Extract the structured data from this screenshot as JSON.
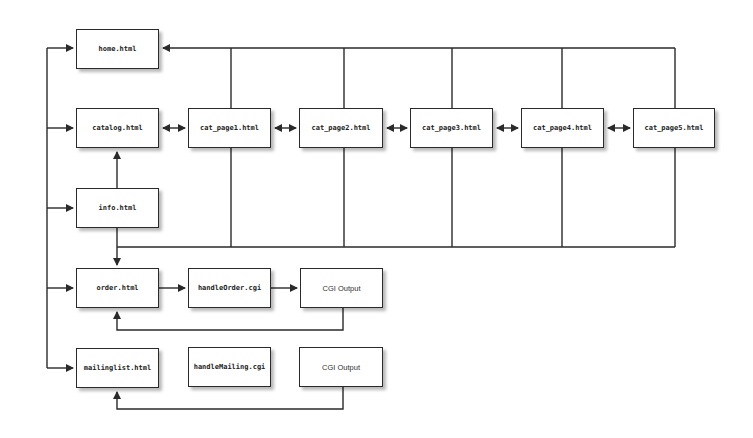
{
  "diagram": {
    "title": "",
    "nodes": [
      {
        "id": "home",
        "label": "home.html",
        "x": 76,
        "y": 29,
        "w": 83,
        "h": 40,
        "style": "mono"
      },
      {
        "id": "catalog",
        "label": "catalog.html",
        "x": 76,
        "y": 108,
        "w": 83,
        "h": 40,
        "style": "mono"
      },
      {
        "id": "cat1",
        "label": "cat_page1.html",
        "x": 188,
        "y": 108,
        "w": 83,
        "h": 40,
        "style": "mono"
      },
      {
        "id": "cat2",
        "label": "cat_page2.html",
        "x": 299,
        "y": 108,
        "w": 84,
        "h": 40,
        "style": "mono"
      },
      {
        "id": "cat3",
        "label": "cat_page3.html",
        "x": 410,
        "y": 108,
        "w": 83,
        "h": 40,
        "style": "mono"
      },
      {
        "id": "cat4",
        "label": "cat_page4.html",
        "x": 521,
        "y": 108,
        "w": 83,
        "h": 40,
        "style": "mono"
      },
      {
        "id": "cat5",
        "label": "cat_page5.html",
        "x": 633,
        "y": 108,
        "w": 82,
        "h": 40,
        "style": "mono"
      },
      {
        "id": "info",
        "label": "info.html",
        "x": 76,
        "y": 188,
        "w": 83,
        "h": 40,
        "style": "mono"
      },
      {
        "id": "order",
        "label": "order.html",
        "x": 76,
        "y": 268,
        "w": 83,
        "h": 40,
        "style": "mono"
      },
      {
        "id": "handleOrder",
        "label": "handleOrder.cgi",
        "x": 188,
        "y": 268,
        "w": 83,
        "h": 40,
        "style": "mono"
      },
      {
        "id": "cgiOut1",
        "label": "CGI Output",
        "x": 300,
        "y": 268,
        "w": 83,
        "h": 40,
        "style": "plain"
      },
      {
        "id": "mailing",
        "label": "mailinglist.html",
        "x": 76,
        "y": 348,
        "w": 83,
        "h": 40,
        "style": "mono"
      },
      {
        "id": "handleMailing",
        "label": "handleMailing.cgi",
        "x": 188,
        "y": 347,
        "w": 83,
        "h": 40,
        "style": "mono"
      },
      {
        "id": "cgiOut2",
        "label": "CGI Output",
        "x": 299,
        "y": 347,
        "w": 84,
        "h": 40,
        "style": "plain"
      }
    ],
    "edges": [
      {
        "from": "nav",
        "to": "home"
      },
      {
        "from": "nav",
        "to": "catalog"
      },
      {
        "from": "nav",
        "to": "info"
      },
      {
        "from": "nav",
        "to": "order"
      },
      {
        "from": "nav",
        "to": "mailing"
      },
      {
        "from": "catalog",
        "to": "cat1",
        "bidirectional": true
      },
      {
        "from": "cat1",
        "to": "cat2",
        "bidirectional": true
      },
      {
        "from": "cat2",
        "to": "cat3",
        "bidirectional": true
      },
      {
        "from": "cat3",
        "to": "cat4",
        "bidirectional": true
      },
      {
        "from": "cat4",
        "to": "cat5",
        "bidirectional": true
      },
      {
        "from": "cat_pages",
        "to": "home"
      },
      {
        "from": "info",
        "to": "catalog"
      },
      {
        "from": "cat_pages",
        "to": "order"
      },
      {
        "from": "info",
        "to": "order"
      },
      {
        "from": "order",
        "to": "handleOrder"
      },
      {
        "from": "handleOrder",
        "to": "cgiOut1"
      },
      {
        "from": "cgiOut1",
        "to": "order"
      },
      {
        "from": "cgiOut2",
        "to": "mailing"
      }
    ],
    "colors": {
      "line": "#2a2a2a",
      "box_border": "#2a2a2a",
      "background": "#ffffff"
    }
  }
}
